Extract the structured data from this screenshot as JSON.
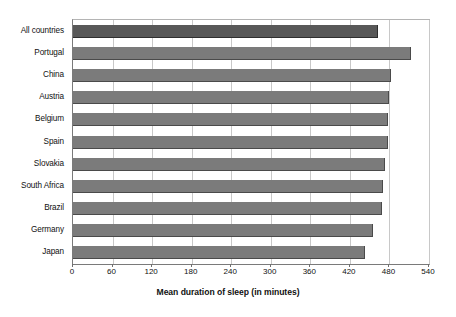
{
  "chart_data": {
    "type": "bar",
    "orientation": "horizontal",
    "title": "",
    "subtitle": "",
    "xlabel": "Mean duration of sleep (in minutes)",
    "ylabel": "",
    "xlim": [
      0,
      540
    ],
    "xticks": [
      0,
      60,
      120,
      180,
      240,
      300,
      360,
      420,
      480,
      540
    ],
    "xtick_labels": [
      "0",
      "60",
      "120",
      "180",
      "240",
      "300",
      "360",
      "420",
      "480",
      "540"
    ],
    "grid": true,
    "grid_axis": "x",
    "legend": null,
    "categories": [
      "All countries",
      "Portugal",
      "China",
      "Austria",
      "Belgium",
      "Spain",
      "Slovakia",
      "South Africa",
      "Brazil",
      "Germany",
      "Japan"
    ],
    "values": [
      463,
      513,
      483,
      480,
      478,
      478,
      473,
      470,
      469,
      455,
      443
    ],
    "series": [
      {
        "name": "Mean duration of sleep (in minutes)",
        "values": [
          463,
          513,
          483,
          480,
          478,
          478,
          473,
          470,
          469,
          455,
          443
        ]
      }
    ],
    "highlight_index": 0,
    "colors": {
      "bar": "#7b7b7b",
      "bar_highlight": "#585858",
      "bar_edge": "#4a4a4a",
      "gridline": "#c8c8c8",
      "axis": "#7a7a7a",
      "text": "#111111",
      "background": "#ffffff"
    }
  }
}
